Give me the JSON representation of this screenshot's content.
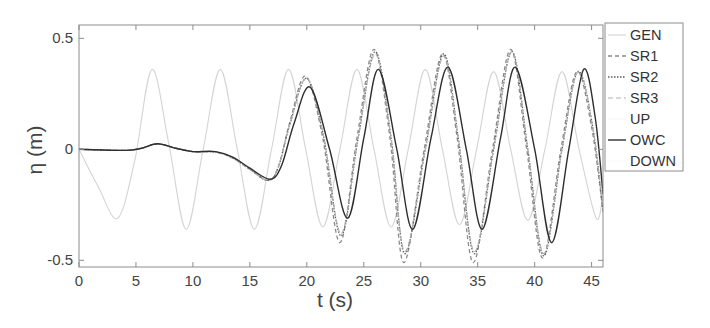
{
  "chart_data": {
    "type": "line",
    "title": "",
    "xlabel": "t (s)",
    "ylabel": "η (m)",
    "xlim": [
      0,
      46
    ],
    "ylim": [
      -0.53,
      0.56
    ],
    "xticks": [
      0,
      5,
      10,
      15,
      20,
      25,
      30,
      35,
      40,
      45
    ],
    "xtick_labels": [
      "0",
      "5",
      "10",
      "15",
      "20",
      "25",
      "30",
      "35",
      "40",
      "45"
    ],
    "yticks": [
      -0.5,
      0,
      0.5
    ],
    "ytick_labels": [
      "-0.5",
      "0",
      "0.5"
    ],
    "grid": false,
    "legend_position": "outside-right-top",
    "series": [
      {
        "name": "GEN",
        "color": "#d4d4d4",
        "dash": "",
        "width": 1.1,
        "points": [
          [
            0,
            0
          ],
          [
            1.7,
            -0.17
          ],
          [
            3.4,
            -0.31
          ],
          [
            4.9,
            -0.05
          ],
          [
            6.4,
            0.36
          ],
          [
            7.9,
            0.02
          ],
          [
            9.4,
            -0.36
          ],
          [
            10.9,
            0.0
          ],
          [
            12.4,
            0.36
          ],
          [
            13.9,
            0.0
          ],
          [
            15.4,
            -0.36
          ],
          [
            16.9,
            0.0
          ],
          [
            18.4,
            0.36
          ],
          [
            19.9,
            0.0
          ],
          [
            21.4,
            -0.35
          ],
          [
            22.9,
            0.0
          ],
          [
            24.4,
            0.36
          ],
          [
            25.9,
            0.0
          ],
          [
            27.4,
            -0.35
          ],
          [
            28.9,
            0.0
          ],
          [
            30.4,
            0.36
          ],
          [
            31.9,
            0.0
          ],
          [
            33.4,
            -0.34
          ],
          [
            34.9,
            0.0
          ],
          [
            36.4,
            0.35
          ],
          [
            37.9,
            0.0
          ],
          [
            39.4,
            -0.32
          ],
          [
            40.9,
            0.0
          ],
          [
            42.4,
            0.35
          ],
          [
            43.9,
            0.0
          ],
          [
            45.4,
            -0.31
          ],
          [
            46,
            -0.2
          ]
        ]
      },
      {
        "name": "SR1",
        "color": "#8a8a8a",
        "dash": "4 3",
        "width": 1.3,
        "points": [
          [
            0,
            0
          ],
          [
            4,
            -0.005
          ],
          [
            5.5,
            0.005
          ],
          [
            6.9,
            0.025
          ],
          [
            8.5,
            0.005
          ],
          [
            10,
            -0.01
          ],
          [
            12,
            -0.012
          ],
          [
            13.5,
            -0.04
          ],
          [
            15,
            -0.09
          ],
          [
            16.6,
            -0.14
          ],
          [
            17.5,
            -0.08
          ],
          [
            18.5,
            0.12
          ],
          [
            19.9,
            0.33
          ],
          [
            21.4,
            0.05
          ],
          [
            22.9,
            -0.42
          ],
          [
            24.4,
            0.05
          ],
          [
            25.9,
            0.45
          ],
          [
            27.3,
            0.05
          ],
          [
            28.5,
            -0.51
          ],
          [
            30.3,
            0.0
          ],
          [
            31.9,
            0.43
          ],
          [
            33.2,
            0.05
          ],
          [
            34.6,
            -0.51
          ],
          [
            36.3,
            0.0
          ],
          [
            37.9,
            0.45
          ],
          [
            39.3,
            0.0
          ],
          [
            40.7,
            -0.49
          ],
          [
            42.3,
            0.0
          ],
          [
            43.7,
            0.35
          ],
          [
            45,
            0.1
          ],
          [
            46,
            -0.28
          ]
        ]
      },
      {
        "name": "SR2",
        "color": "#5c5c5c",
        "dash": "1.5 1.5",
        "width": 1.3,
        "points": [
          [
            0,
            0
          ],
          [
            4,
            -0.005
          ],
          [
            5.5,
            0.005
          ],
          [
            6.9,
            0.025
          ],
          [
            8.5,
            0.005
          ],
          [
            10,
            -0.01
          ],
          [
            12,
            -0.012
          ],
          [
            13.5,
            -0.04
          ],
          [
            15,
            -0.09
          ],
          [
            16.6,
            -0.14
          ],
          [
            17.5,
            -0.08
          ],
          [
            18.5,
            0.11
          ],
          [
            20.0,
            0.32
          ],
          [
            21.5,
            0.05
          ],
          [
            23.0,
            -0.39
          ],
          [
            24.5,
            0.05
          ],
          [
            26.0,
            0.44
          ],
          [
            27.4,
            0.05
          ],
          [
            28.6,
            -0.47
          ],
          [
            30.4,
            0.0
          ],
          [
            32.0,
            0.43
          ],
          [
            33.3,
            0.05
          ],
          [
            34.7,
            -0.47
          ],
          [
            36.4,
            0.0
          ],
          [
            38.0,
            0.44
          ],
          [
            39.4,
            0.0
          ],
          [
            40.8,
            -0.48
          ],
          [
            42.4,
            0.0
          ],
          [
            43.8,
            0.35
          ],
          [
            45.1,
            0.1
          ],
          [
            46,
            -0.28
          ]
        ]
      },
      {
        "name": "SR3",
        "color": "#b0b0b0",
        "dash": "5 3",
        "width": 1.2,
        "points": [
          [
            0,
            0
          ],
          [
            4,
            -0.005
          ],
          [
            5.5,
            0.005
          ],
          [
            6.9,
            0.025
          ],
          [
            8.5,
            0.005
          ],
          [
            10,
            -0.01
          ],
          [
            12,
            -0.012
          ],
          [
            13.5,
            -0.04
          ],
          [
            15,
            -0.09
          ],
          [
            16.6,
            -0.14
          ],
          [
            17.5,
            -0.08
          ],
          [
            18.5,
            0.11
          ],
          [
            20.0,
            0.32
          ],
          [
            21.5,
            0.05
          ],
          [
            23.0,
            -0.38
          ],
          [
            24.5,
            0.05
          ],
          [
            26.0,
            0.43
          ],
          [
            27.4,
            0.05
          ],
          [
            28.6,
            -0.46
          ],
          [
            30.4,
            0.0
          ],
          [
            32.0,
            0.42
          ],
          [
            33.3,
            0.05
          ],
          [
            34.7,
            -0.46
          ],
          [
            36.4,
            0.0
          ],
          [
            38.0,
            0.44
          ],
          [
            39.4,
            0.0
          ],
          [
            40.8,
            -0.47
          ],
          [
            42.4,
            0.0
          ],
          [
            43.8,
            0.35
          ],
          [
            45.1,
            0.1
          ],
          [
            46,
            -0.27
          ]
        ]
      },
      {
        "name": "UP",
        "color": "#f4f4f4",
        "dash": "",
        "width": 1.0,
        "points": []
      },
      {
        "name": "OWC",
        "color": "#2e2e2e",
        "dash": "",
        "width": 1.4,
        "points": [
          [
            0,
            0
          ],
          [
            4,
            -0.005
          ],
          [
            5.5,
            0.005
          ],
          [
            6.9,
            0.025
          ],
          [
            8.5,
            0.005
          ],
          [
            10,
            -0.01
          ],
          [
            12,
            -0.01
          ],
          [
            13.5,
            -0.035
          ],
          [
            15,
            -0.085
          ],
          [
            16.8,
            -0.135
          ],
          [
            17.8,
            -0.07
          ],
          [
            18.9,
            0.12
          ],
          [
            20.3,
            0.28
          ],
          [
            22.0,
            0.0
          ],
          [
            23.6,
            -0.31
          ],
          [
            25.0,
            0.05
          ],
          [
            26.3,
            0.36
          ],
          [
            27.9,
            0.0
          ],
          [
            29.3,
            -0.36
          ],
          [
            30.9,
            0.05
          ],
          [
            32.4,
            0.37
          ],
          [
            34.0,
            0.0
          ],
          [
            35.4,
            -0.36
          ],
          [
            37.0,
            0.05
          ],
          [
            38.3,
            0.37
          ],
          [
            40.0,
            0.0
          ],
          [
            41.5,
            -0.42
          ],
          [
            43.0,
            0.0
          ],
          [
            44.3,
            0.36
          ],
          [
            45.3,
            0.15
          ],
          [
            46,
            -0.2
          ]
        ]
      },
      {
        "name": "DOWN",
        "color": "#f8f8f8",
        "dash": "",
        "width": 1.0,
        "points": []
      }
    ]
  },
  "legend": {
    "items": [
      {
        "label": "GEN"
      },
      {
        "label": "SR1"
      },
      {
        "label": "SR2"
      },
      {
        "label": "SR3"
      },
      {
        "label": "UP"
      },
      {
        "label": "OWC"
      },
      {
        "label": "DOWN"
      }
    ]
  },
  "axes": {
    "xlabel": "t (s)",
    "ylabel": "η (m)"
  }
}
